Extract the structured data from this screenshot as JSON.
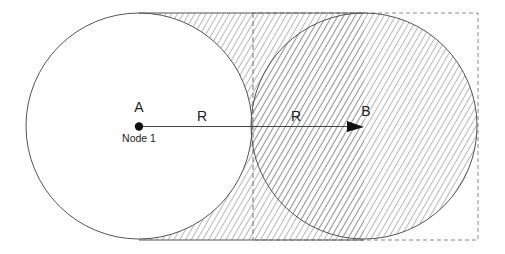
{
  "diagram": {
    "node_a": {
      "label": "A",
      "sublabel": "Node 1",
      "cx": 139,
      "cy": 126
    },
    "node_b": {
      "label": "B",
      "cx": 364,
      "cy": 126
    },
    "radius_label_1": "R",
    "radius_label_2": "R",
    "radius": 113,
    "colors": {
      "stroke": "#555555",
      "hatch": "#8a8a8a",
      "text": "#222222",
      "dashed": "#888888"
    }
  }
}
